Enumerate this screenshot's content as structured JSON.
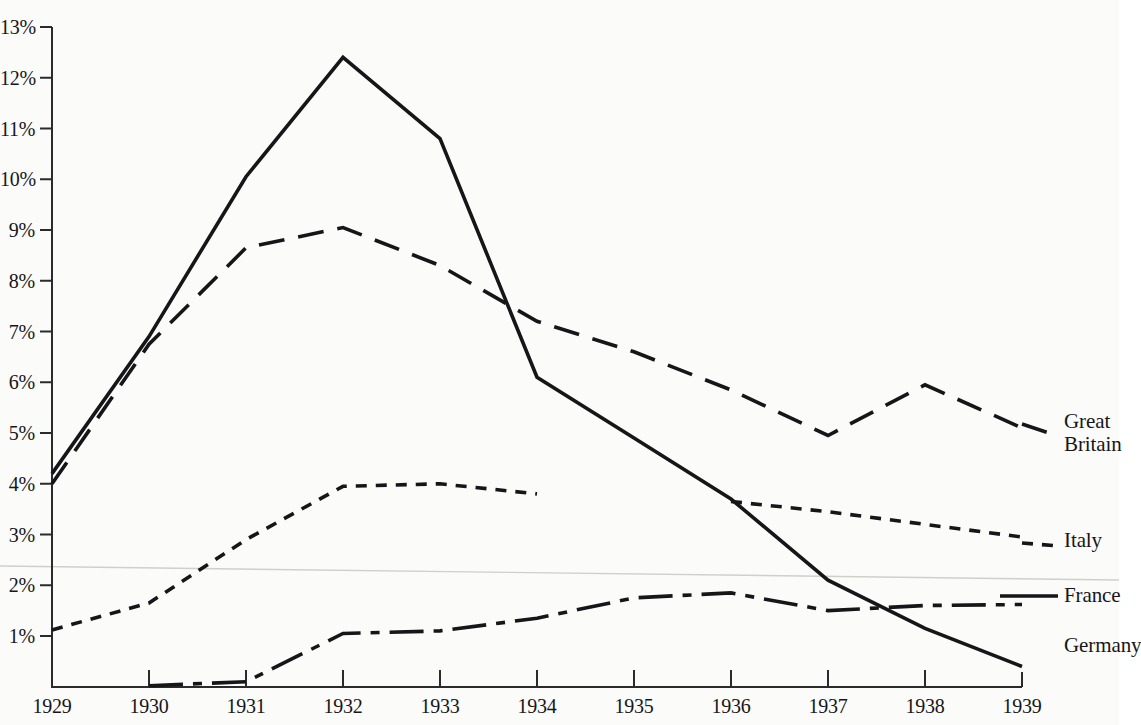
{
  "chart_data": {
    "type": "line",
    "title": "",
    "subtitle": "",
    "xlabel": "",
    "ylabel": "",
    "x": [
      1929,
      1930,
      1931,
      1932,
      1933,
      1934,
      1935,
      1936,
      1937,
      1938,
      1939
    ],
    "xlim": [
      1929,
      1939
    ],
    "ylim": [
      0,
      13
    ],
    "grid": false,
    "legend_position": "right-inline",
    "y_tick_labels": [
      "1%",
      "2%",
      "3%",
      "4%",
      "5%",
      "6%",
      "7%",
      "8%",
      "9%",
      "10%",
      "11%",
      "12%",
      "13%"
    ],
    "y_tick_values": [
      1,
      2,
      3,
      4,
      5,
      6,
      7,
      8,
      9,
      10,
      11,
      12,
      13
    ],
    "x_tick_labels": [
      "1929",
      "1930",
      "1931",
      "1932",
      "1933",
      "1934",
      "1935",
      "1936",
      "1937",
      "1938",
      "1939"
    ],
    "series": [
      {
        "name": "Great Britain",
        "style": "dashed",
        "label": "Great\nBritain",
        "values": [
          4.0,
          6.75,
          8.65,
          9.05,
          8.3,
          7.2,
          6.6,
          5.85,
          4.95,
          5.95,
          5.1
        ]
      },
      {
        "name": "Italy",
        "style": "dotted",
        "label": "Italy",
        "values": [
          1.12,
          1.65,
          2.9,
          3.95,
          4.0,
          3.8,
          null,
          3.65,
          3.45,
          3.2,
          2.95
        ],
        "gap_note": "series breaks after 1934 and resumes mid-1936"
      },
      {
        "name": "France",
        "style": "solid",
        "label": "France",
        "values": [
          4.2,
          6.9,
          10.05,
          12.4,
          10.8,
          6.1,
          4.9,
          3.7,
          2.1,
          1.15,
          0.4
        ]
      },
      {
        "name": "Germany",
        "style": "dash-dot",
        "label": "Germany",
        "values": [
          null,
          0.02,
          0.1,
          1.05,
          1.1,
          1.35,
          1.75,
          1.85,
          1.5,
          1.6,
          1.62
        ]
      }
    ]
  },
  "annotations": {
    "fold_line": "faint horizontal page-fold artifact near 2.4%"
  }
}
